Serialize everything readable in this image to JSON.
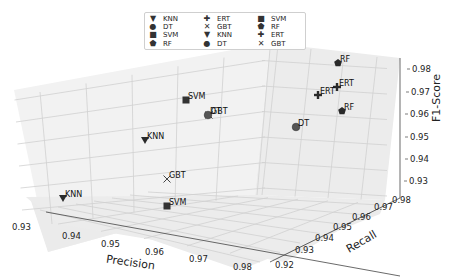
{
  "chart_data": {
    "type": "scatter",
    "projection": "3d",
    "title": "",
    "xlabel": "Precision",
    "ylabel": "Recall",
    "zlabel": "F1-Score",
    "xlim": [
      0.925,
      0.985
    ],
    "ylim": [
      0.915,
      0.985
    ],
    "zlim": [
      0.925,
      0.985
    ],
    "x_ticks": [
      "0.93",
      "0.94",
      "0.95",
      "0.96",
      "0.97",
      "0.98"
    ],
    "y_ticks": [
      "0.92",
      "0.93",
      "0.94",
      "0.95",
      "0.96",
      "0.97",
      "0.98"
    ],
    "z_ticks": [
      "0.93",
      "0.94",
      "0.95",
      "0.96",
      "0.97",
      "0.98"
    ],
    "grid": true,
    "legend_position": "upper center",
    "series": [
      {
        "name": "KNN",
        "marker": "triangle-down",
        "points": [
          {
            "precision": 0.935,
            "recall": 0.925,
            "f1": 0.93
          }
        ]
      },
      {
        "name": "DT",
        "marker": "circle",
        "points": [
          {
            "precision": 0.955,
            "recall": 0.945,
            "f1": 0.95
          }
        ]
      },
      {
        "name": "SVM",
        "marker": "square",
        "points": [
          {
            "precision": 0.96,
            "recall": 0.92,
            "f1": 0.93
          }
        ]
      },
      {
        "name": "RF",
        "marker": "pentagon",
        "points": [
          {
            "precision": 0.965,
            "recall": 0.975,
            "f1": 0.98
          }
        ]
      },
      {
        "name": "ERT",
        "marker": "plus",
        "points": [
          {
            "precision": 0.962,
            "recall": 0.972,
            "f1": 0.97
          }
        ]
      },
      {
        "name": "GBT",
        "marker": "x",
        "points": [
          {
            "precision": 0.955,
            "recall": 0.93,
            "f1": 0.935
          }
        ]
      },
      {
        "name": "SVM",
        "marker": "square",
        "points": [
          {
            "precision": 0.945,
            "recall": 0.965,
            "f1": 0.96
          }
        ]
      },
      {
        "name": "KNN",
        "marker": "triangle-down",
        "points": [
          {
            "precision": 0.94,
            "recall": 0.945,
            "f1": 0.945
          }
        ]
      },
      {
        "name": "ERT",
        "marker": "plus",
        "points": [
          {
            "precision": 0.958,
            "recall": 0.975,
            "f1": 0.968
          }
        ]
      },
      {
        "name": "RF",
        "marker": "pentagon",
        "points": [
          {
            "precision": 0.965,
            "recall": 0.965,
            "f1": 0.96
          }
        ]
      },
      {
        "name": "DT",
        "marker": "circle",
        "points": [
          {
            "precision": 0.95,
            "recall": 0.96,
            "f1": 0.955
          }
        ]
      },
      {
        "name": "GBT",
        "marker": "x",
        "points": [
          {
            "precision": 0.952,
            "recall": 0.962,
            "f1": 0.955
          }
        ]
      }
    ],
    "screen_points": [
      {
        "label": "KNN",
        "marker": "triangle-down",
        "x": 63,
        "y": 198
      },
      {
        "label": "KNN",
        "marker": "triangle-down",
        "x": 145,
        "y": 140
      },
      {
        "label": "SVM",
        "marker": "square",
        "x": 167,
        "y": 206
      },
      {
        "label": "GBT",
        "marker": "x",
        "x": 167,
        "y": 179
      },
      {
        "label": "SVM",
        "marker": "square",
        "x": 186,
        "y": 100
      },
      {
        "label": "GBT",
        "marker": "x",
        "x": 209,
        "y": 115
      },
      {
        "label": "DT",
        "marker": "circle",
        "x": 208,
        "y": 115
      },
      {
        "label": "DT",
        "marker": "circle",
        "x": 296,
        "y": 127
      },
      {
        "label": "RF",
        "marker": "pentagon",
        "x": 338,
        "y": 63
      },
      {
        "label": "ERT",
        "marker": "plus",
        "x": 337,
        "y": 87
      },
      {
        "label": "ERT",
        "marker": "plus",
        "x": 318,
        "y": 95
      },
      {
        "label": "RF",
        "marker": "pentagon",
        "x": 342,
        "y": 111
      }
    ]
  },
  "legend": {
    "items": [
      {
        "label": "KNN",
        "glyph": "▼"
      },
      {
        "label": "ERT",
        "glyph": "✚"
      },
      {
        "label": "SVM",
        "glyph": "■"
      },
      {
        "label": "DT",
        "glyph": "●"
      },
      {
        "label": "GBT",
        "glyph": "✕"
      },
      {
        "label": "RF",
        "glyph": "⬟"
      },
      {
        "label": "SVM",
        "glyph": "■"
      },
      {
        "label": "KNN",
        "glyph": "▼"
      },
      {
        "label": "ERT",
        "glyph": "✚"
      },
      {
        "label": "RF",
        "glyph": "⬟"
      },
      {
        "label": "DT",
        "glyph": "●"
      },
      {
        "label": "GBT",
        "glyph": "✕"
      }
    ]
  },
  "colors": {
    "pane": "#f0f0f0",
    "pane_side": "#e9e9e9",
    "grid": "#d2d2d2",
    "marker": "#2a2a2a",
    "axis": "#333333"
  }
}
